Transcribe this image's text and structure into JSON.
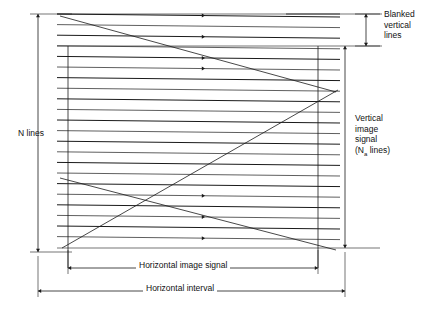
{
  "figure": {
    "type": "raster-scan-timing-diagram",
    "background_color": "#ffffff",
    "line_color": "#1a1a1a",
    "width": 442,
    "height": 314
  },
  "labels": {
    "n_lines": "N lines",
    "blanked_vertical_lines": "Blanked\nvertical\nlines",
    "vertical_image_signal_line1": "Vertical",
    "vertical_image_signal_line2": "image",
    "vertical_image_signal_line3": "signal",
    "vertical_image_signal_line4_prefix": "(N",
    "vertical_image_signal_subscript": "a",
    "vertical_image_signal_line4_suffix": " lines)",
    "horizontal_image_signal": "Horizontal image signal",
    "horizontal_interval": "Horizontal interval"
  },
  "dimensions": {
    "n_lines": {
      "orientation": "vertical",
      "x": 38,
      "y_top": 14,
      "y_bottom": 252,
      "arrows": "both"
    },
    "blanked_vertical_lines": {
      "orientation": "vertical",
      "x": 366,
      "y_top": 14,
      "y_bottom": 46,
      "arrows": "both"
    },
    "vertical_image_signal": {
      "orientation": "vertical",
      "x": 345,
      "y_top": 46,
      "y_bottom": 248,
      "arrows": "both"
    },
    "horizontal_image_signal": {
      "orientation": "horizontal",
      "y": 268,
      "x_left": 68,
      "x_right": 318,
      "arrows": "both"
    },
    "horizontal_interval": {
      "orientation": "horizontal",
      "y": 291,
      "x_left": 38,
      "x_right": 345,
      "arrows": "both"
    }
  },
  "raster": {
    "x_left": 57,
    "x_right": 340,
    "scan_line_count": 22,
    "first_line_y_left": 14,
    "line_spacing": 10.6,
    "line_drop": 11.6,
    "arrow_x": 205,
    "arrow_line_indices": [
      0,
      2,
      4,
      5,
      17,
      19,
      21
    ],
    "retrace_count": 2,
    "retraces": [
      {
        "x1": 60,
        "y1": 16,
        "x2": 336,
        "y2": 92
      },
      {
        "x1": 60,
        "y1": 178,
        "x2": 336,
        "y2": 250
      }
    ],
    "vertical_retrace": [
      {
        "x1": 62,
        "y1": 248,
        "x2": 338,
        "y2": 90
      }
    ]
  },
  "guides": {
    "top_right_segment": {
      "x1": 286,
      "y1": 14,
      "x2": 340,
      "y2": 14
    },
    "blank_boundary_top": {
      "x1": 57,
      "y1": 14,
      "x2": 380,
      "y2": 14
    },
    "blank_boundary_bottom": {
      "x1": 57,
      "y1": 46,
      "x2": 380,
      "y2": 46
    },
    "image_bottom": {
      "x1": 57,
      "y1": 248,
      "x2": 380,
      "y2": 248
    },
    "frame_left": {
      "x": 68,
      "y1": 46,
      "y2": 268
    },
    "frame_right": {
      "x": 318,
      "y1": 46,
      "y2": 268
    }
  }
}
